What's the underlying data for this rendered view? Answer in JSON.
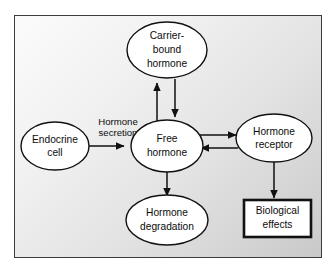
{
  "figure": {
    "frame_border_color": "#3c3c3c",
    "node_fill_color": "#ffffff",
    "node_stroke_color": "#111111",
    "arrow_color": "#111111"
  },
  "nodes": {
    "endocrine_cell": {
      "shape": "ellipse",
      "line1": "Endocrine",
      "line2": "cell"
    },
    "carrier_bound_hormone": {
      "shape": "ellipse",
      "line1": "Carrier-",
      "line2": "bound",
      "line3": "hormone"
    },
    "free_hormone": {
      "shape": "ellipse",
      "line1": "Free",
      "line2": "hormone"
    },
    "hormone_receptor": {
      "shape": "ellipse",
      "line1": "Hormone",
      "line2": "receptor"
    },
    "hormone_degradation": {
      "shape": "ellipse",
      "line1": "Hormone",
      "line2": "degradation"
    },
    "biological_effects": {
      "shape": "rectangle",
      "line1": "Biological",
      "line2": "effects"
    }
  },
  "edges": {
    "secretion": {
      "label_line1": "Hormone",
      "label_line2": "secretion",
      "from": "endocrine_cell",
      "to": "free_hormone",
      "direction": "right"
    },
    "free_to_carrier": {
      "from": "free_hormone",
      "to": "carrier_bound_hormone",
      "direction": "up"
    },
    "carrier_to_free": {
      "from": "carrier_bound_hormone",
      "to": "free_hormone",
      "direction": "down"
    },
    "free_to_receptor": {
      "from": "free_hormone",
      "to": "hormone_receptor",
      "direction": "right"
    },
    "receptor_to_free": {
      "from": "hormone_receptor",
      "to": "free_hormone",
      "direction": "left"
    },
    "free_to_degradation": {
      "from": "free_hormone",
      "to": "hormone_degradation",
      "direction": "down"
    },
    "receptor_to_effects": {
      "from": "hormone_receptor",
      "to": "biological_effects",
      "direction": "down"
    }
  }
}
